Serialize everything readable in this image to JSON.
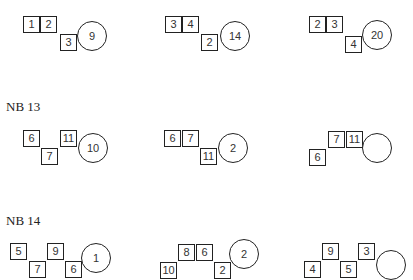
{
  "sections": [
    {
      "label": "",
      "puzzles": [
        {
          "boxes": [
            {
              "v": "1",
              "x": 23,
              "y": 16
            },
            {
              "v": "2",
              "x": 40,
              "y": 16
            },
            {
              "v": "3",
              "x": 60,
              "y": 34
            }
          ],
          "circle": {
            "v": "9",
            "cx": 92,
            "cy": 36,
            "d": 30
          }
        },
        {
          "boxes": [
            {
              "v": "3",
              "x": 165,
              "y": 16
            },
            {
              "v": "4",
              "x": 182,
              "y": 16
            },
            {
              "v": "2",
              "x": 201,
              "y": 34
            }
          ],
          "circle": {
            "v": "14",
            "cx": 235,
            "cy": 36,
            "d": 30
          }
        },
        {
          "boxes": [
            {
              "v": "2",
              "x": 309,
              "y": 16
            },
            {
              "v": "3",
              "x": 326,
              "y": 16
            },
            {
              "v": "4",
              "x": 345,
              "y": 36
            }
          ],
          "circle": {
            "v": "20",
            "cx": 377,
            "cy": 35,
            "d": 30
          }
        }
      ]
    },
    {
      "label": "NB 13",
      "label_x": 6,
      "label_y": 99,
      "puzzles": [
        {
          "boxes": [
            {
              "v": "6",
              "x": 23,
              "y": 130
            },
            {
              "v": "7",
              "x": 41,
              "y": 148
            },
            {
              "v": "11",
              "x": 60,
              "y": 130
            }
          ],
          "circle": {
            "v": "10",
            "cx": 93,
            "cy": 148,
            "d": 30
          }
        },
        {
          "boxes": [
            {
              "v": "6",
              "x": 164,
              "y": 130
            },
            {
              "v": "7",
              "x": 182,
              "y": 130
            },
            {
              "v": "11",
              "x": 200,
              "y": 148
            }
          ],
          "circle": {
            "v": "2",
            "cx": 233,
            "cy": 148,
            "d": 30
          }
        },
        {
          "boxes": [
            {
              "v": "6",
              "x": 309,
              "y": 149
            },
            {
              "v": "7",
              "x": 328,
              "y": 131
            },
            {
              "v": "11",
              "x": 346,
              "y": 131
            }
          ],
          "circle": {
            "v": "",
            "cx": 377,
            "cy": 148,
            "d": 30
          }
        }
      ]
    },
    {
      "label": "NB 14",
      "label_x": 6,
      "label_y": 213,
      "puzzles": [
        {
          "boxes": [
            {
              "v": "5",
              "x": 10,
              "y": 243
            },
            {
              "v": "7",
              "x": 29,
              "y": 261
            },
            {
              "v": "9",
              "x": 47,
              "y": 243
            },
            {
              "v": "6",
              "x": 65,
              "y": 261
            }
          ],
          "circle": {
            "v": "1",
            "cx": 96,
            "cy": 258,
            "d": 30
          }
        },
        {
          "boxes": [
            {
              "v": "10",
              "x": 160,
              "y": 262
            },
            {
              "v": "8",
              "x": 178,
              "y": 244
            },
            {
              "v": "6",
              "x": 196,
              "y": 244
            },
            {
              "v": "2",
              "x": 214,
              "y": 262
            }
          ],
          "circle": {
            "v": "2",
            "cx": 244,
            "cy": 254,
            "d": 30
          }
        },
        {
          "boxes": [
            {
              "v": "4",
              "x": 304,
              "y": 261
            },
            {
              "v": "9",
              "x": 322,
              "y": 243
            },
            {
              "v": "5",
              "x": 340,
              "y": 261
            },
            {
              "v": "3",
              "x": 358,
              "y": 243
            }
          ],
          "circle": {
            "v": "",
            "cx": 391,
            "cy": 265,
            "d": 30
          }
        }
      ]
    }
  ]
}
